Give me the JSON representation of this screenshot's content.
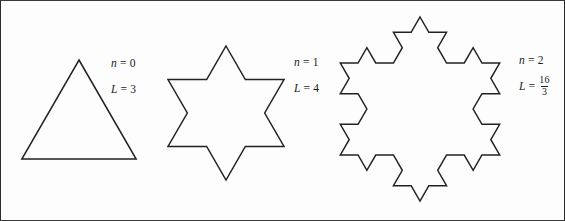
{
  "figure": {
    "background_color": "#fdfdfd",
    "border_color": "#2b2b2b",
    "stroke_color": "#222222"
  },
  "stages": [
    {
      "id": "stage-0",
      "iteration_label_var": "n",
      "iteration_label_eq": "=",
      "iteration_label_value": "0",
      "length_label_var": "L",
      "length_label_eq": "=",
      "length_label_value": "3",
      "length_is_fraction": false,
      "shape": "equilateral-triangle",
      "cx": 78,
      "cy": 125,
      "radius": 66,
      "depth": 0
    },
    {
      "id": "stage-1",
      "iteration_label_var": "n",
      "iteration_label_eq": "=",
      "iteration_label_value": "1",
      "length_label_var": "L",
      "length_label_eq": "=",
      "length_label_value": "4",
      "length_is_fraction": false,
      "shape": "koch-snowflake",
      "cx": 225,
      "cy": 112,
      "radius": 67,
      "depth": 1
    },
    {
      "id": "stage-2",
      "iteration_label_var": "n",
      "iteration_label_eq": "=",
      "iteration_label_value": "",
      "iteration_value": "2",
      "length_label_var": "L",
      "length_label_eq": "=",
      "length_numerator": "16",
      "length_denominator": "3",
      "length_is_fraction": true,
      "shape": "koch-snowflake",
      "cx": 419,
      "cy": 108,
      "radius": 92,
      "depth": 2
    }
  ],
  "labels": {
    "stage0_n": {
      "var": "n",
      "eq": "=",
      "value": "0"
    },
    "stage0_L": {
      "var": "L",
      "eq": "=",
      "value": "3"
    },
    "stage1_n": {
      "var": "n",
      "eq": "=",
      "value": "1"
    },
    "stage1_L": {
      "var": "L",
      "eq": "=",
      "value": "4"
    },
    "stage2_n": {
      "var": "n",
      "eq": "=",
      "value": "2"
    },
    "stage2_L": {
      "var": "L",
      "eq": "=",
      "numerator": "16",
      "denominator": "3"
    }
  },
  "chart_data": {
    "type": "diagram",
    "iterations": [
      0,
      1,
      2
    ],
    "perimeters": [
      3,
      4,
      5.3333
    ],
    "perimeter_labels": [
      "3",
      "4",
      "16/3"
    ],
    "segment_counts": [
      3,
      12,
      48
    ],
    "note": "Each iteration multiplies the perimeter by 4/3"
  }
}
